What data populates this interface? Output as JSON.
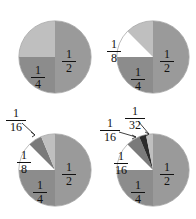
{
  "figure": {
    "background_color": "#ffffff",
    "panel_count": 4
  },
  "colors": {
    "half": "#9a9a9a",
    "quarter": "#8c8c8c",
    "eighth": "#ffffff",
    "sixteenth": "#7a7a7a",
    "thirtysecond": "#2b2b2b",
    "remainder": "#bfbfbf",
    "outline": "#8d8d8d",
    "label_text": "#111111",
    "leader_line": "#2a2a2a"
  },
  "labels": {
    "one": "1",
    "two": "2",
    "four": "4",
    "eight": "8",
    "sixteen": "16",
    "thirtytwo": "32"
  },
  "panels": [
    {
      "name": "pie-1",
      "visible_fractions": [
        "1/2",
        "1/4"
      ],
      "slices": [
        {
          "label": "1/2",
          "value": 0.5,
          "color_key": "half",
          "start_deg": 0,
          "sweep_deg": 180
        },
        {
          "label": "1/4",
          "value": 0.25,
          "color_key": "quarter",
          "start_deg": 180,
          "sweep_deg": 90
        },
        {
          "label": "",
          "value": 0.25,
          "color_key": "remainder",
          "start_deg": 270,
          "sweep_deg": 90
        }
      ]
    },
    {
      "name": "pie-2",
      "visible_fractions": [
        "1/2",
        "1/4",
        "1/8"
      ],
      "slices": [
        {
          "label": "1/2",
          "value": 0.5,
          "color_key": "half",
          "start_deg": 0,
          "sweep_deg": 180
        },
        {
          "label": "1/4",
          "value": 0.25,
          "color_key": "quarter",
          "start_deg": 180,
          "sweep_deg": 90
        },
        {
          "label": "1/8",
          "value": 0.125,
          "color_key": "eighth",
          "start_deg": 270,
          "sweep_deg": 45
        },
        {
          "label": "",
          "value": 0.125,
          "color_key": "remainder",
          "start_deg": 315,
          "sweep_deg": 45
        }
      ]
    },
    {
      "name": "pie-3",
      "visible_fractions": [
        "1/2",
        "1/4",
        "1/8",
        "1/16"
      ],
      "slices": [
        {
          "label": "1/2",
          "value": 0.5,
          "color_key": "half",
          "start_deg": 0,
          "sweep_deg": 180
        },
        {
          "label": "1/4",
          "value": 0.25,
          "color_key": "quarter",
          "start_deg": 180,
          "sweep_deg": 90
        },
        {
          "label": "1/8",
          "value": 0.125,
          "color_key": "eighth",
          "start_deg": 270,
          "sweep_deg": 45
        },
        {
          "label": "1/16",
          "value": 0.0625,
          "color_key": "sixteenth",
          "start_deg": 315,
          "sweep_deg": 22.5
        },
        {
          "label": "",
          "value": 0.0625,
          "color_key": "remainder",
          "start_deg": 337.5,
          "sweep_deg": 22.5
        }
      ]
    },
    {
      "name": "pie-4",
      "visible_fractions": [
        "1/2",
        "1/4",
        "1/8",
        "1/16",
        "1/32"
      ],
      "slices": [
        {
          "label": "1/2",
          "value": 0.5,
          "color_key": "half",
          "start_deg": 0,
          "sweep_deg": 180
        },
        {
          "label": "1/4",
          "value": 0.25,
          "color_key": "quarter",
          "start_deg": 180,
          "sweep_deg": 90
        },
        {
          "label": "1/8",
          "value": 0.125,
          "color_key": "eighth",
          "start_deg": 270,
          "sweep_deg": 45
        },
        {
          "label": "1/16",
          "value": 0.0625,
          "color_key": "sixteenth",
          "start_deg": 315,
          "sweep_deg": 22.5
        },
        {
          "label": "1/32",
          "value": 0.03125,
          "color_key": "thirtysecond",
          "start_deg": 337.5,
          "sweep_deg": 11.25
        },
        {
          "label": "",
          "value": 0.03125,
          "color_key": "remainder",
          "start_deg": 348.75,
          "sweep_deg": 11.25
        }
      ]
    }
  ],
  "chart_data": {
    "type": "pie",
    "legend": "none",
    "charts": [
      {
        "name": "pie-1",
        "categories": [
          "1/2",
          "1/4",
          "remainder"
        ],
        "values": [
          0.5,
          0.25,
          0.25
        ],
        "labels_shown": [
          "1/2",
          "1/4"
        ]
      },
      {
        "name": "pie-2",
        "categories": [
          "1/2",
          "1/4",
          "1/8",
          "remainder"
        ],
        "values": [
          0.5,
          0.25,
          0.125,
          0.125
        ],
        "labels_shown": [
          "1/2",
          "1/4",
          "1/8"
        ]
      },
      {
        "name": "pie-3",
        "categories": [
          "1/2",
          "1/4",
          "1/8",
          "1/16",
          "remainder"
        ],
        "values": [
          0.5,
          0.25,
          0.125,
          0.0625,
          0.0625
        ],
        "labels_shown": [
          "1/2",
          "1/4",
          "1/8",
          "1/16"
        ]
      },
      {
        "name": "pie-4",
        "categories": [
          "1/2",
          "1/4",
          "1/8",
          "1/16",
          "1/32",
          "remainder"
        ],
        "values": [
          0.5,
          0.25,
          0.125,
          0.0625,
          0.03125,
          0.03125
        ],
        "labels_shown": [
          "1/2",
          "1/4",
          "1/8",
          "1/16",
          "1/32"
        ]
      }
    ]
  }
}
